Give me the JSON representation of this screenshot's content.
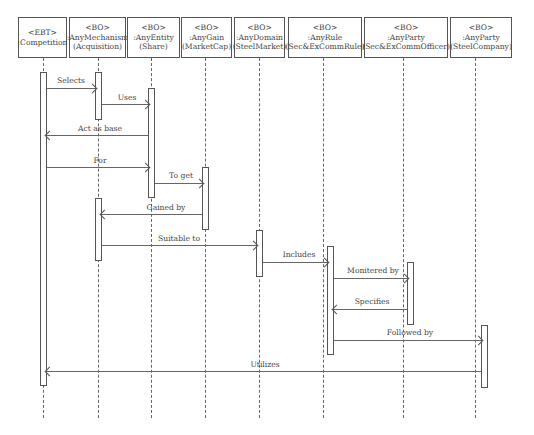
{
  "diagram": {
    "type": "sequence-diagram",
    "participants": [
      {
        "stereotype": "<EBT>",
        "name": ":Competition",
        "instance": ""
      },
      {
        "stereotype": "<BO>",
        "name": ":AnyMechanism",
        "instance": "(Acquisition)"
      },
      {
        "stereotype": "<BO>",
        "name": ":AnyEntity",
        "instance": "(Share)"
      },
      {
        "stereotype": "<BO>",
        "name": ":AnyGain",
        "instance": "(MarketCap)"
      },
      {
        "stereotype": "<BO>",
        "name": ":AnyDomain",
        "instance": "(SteelMarket)"
      },
      {
        "stereotype": "<BO>",
        "name": ":AnyRule",
        "instance": "(Sec&ExCommRule)"
      },
      {
        "stereotype": "<BO>",
        "name": ":AnyParty",
        "instance": "(Sec&ExCommOfficer)"
      },
      {
        "stereotype": "<BO>",
        "name": ":AnyParty",
        "instance": "(SteelCompany)"
      }
    ],
    "messages": [
      {
        "label": "Selects",
        "from": ":Competition",
        "to": ":AnyMechanism"
      },
      {
        "label": "Uses",
        "from": ":AnyMechanism",
        "to": ":AnyEntity"
      },
      {
        "label": "Act as base",
        "from": ":AnyEntity",
        "to": ":Competition"
      },
      {
        "label": "For",
        "from": ":Competition",
        "to": ":AnyEntity"
      },
      {
        "label": "To get",
        "from": ":AnyEntity",
        "to": ":AnyGain"
      },
      {
        "label": "Gained by",
        "from": ":AnyGain",
        "to": ":AnyMechanism"
      },
      {
        "label": "Suitable to",
        "from": ":AnyMechanism",
        "to": ":AnyDomain"
      },
      {
        "label": "Includes",
        "from": ":AnyDomain",
        "to": ":AnyRule"
      },
      {
        "label": "Monitered by",
        "from": ":AnyRule",
        "to": ":AnyParty (Sec&ExCommOfficer)"
      },
      {
        "label": "Specifies",
        "from": ":AnyParty (Sec&ExCommOfficer)",
        "to": ":AnyRule"
      },
      {
        "label": "Followed by",
        "from": ":AnyRule",
        "to": ":AnyParty (SteelCompany)"
      },
      {
        "label": "Utilizes",
        "from": ":AnyParty (SteelCompany)",
        "to": ":Competition"
      }
    ]
  }
}
